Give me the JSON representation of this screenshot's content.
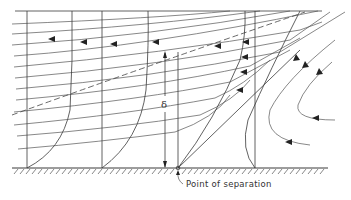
{
  "diagram": {
    "labels": {
      "delta": "δ",
      "separation_point": "Point of separation"
    },
    "colors": {
      "line": "#3a3a3a",
      "background": "#ffffff"
    },
    "stations_x": [
      27,
      102,
      178,
      255
    ],
    "wall_y": 168,
    "top_y": 11
  }
}
